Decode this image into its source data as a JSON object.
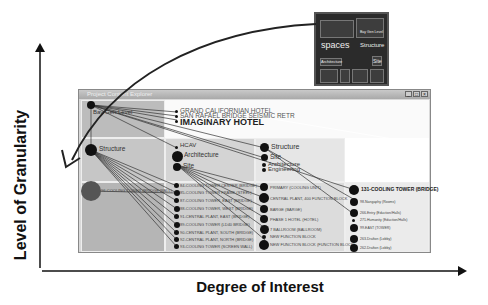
{
  "axes": {
    "y_label": "Level of Granularity",
    "x_label": "Degree of Interest"
  },
  "window": {
    "title": "Project Content Explorer",
    "buttons": [
      "_",
      "□",
      "×"
    ]
  },
  "minimap": {
    "labels": [
      "spaces",
      "Structure",
      "Site",
      "Architecture",
      "Bay Gen Level"
    ]
  },
  "nodes": {
    "root": "Bay Gen Level",
    "hotels": [
      "GRAND CALIFORNIAN HOTEL",
      "SAN RAFAEL BRIDGE SEISMIC RETR",
      "IMAGINARY HOTEL"
    ],
    "col1": [
      "Structure"
    ],
    "col2": [
      "HCAV",
      "Architecture",
      "Site"
    ],
    "col3": [
      "Structure",
      "Site",
      "Architecture",
      "Engineering"
    ],
    "level3_col1": [
      "96-COOLING TOWER (BRIDGE WALL)"
    ],
    "level3_col2": [
      "84-COOLING TOWER CENTER (BRIDGE)",
      "85-COOLING TOWER FRAME (STEEL)",
      "87-COOLING TOWER, EAST (BRIDGE)",
      "88-COOLING TOWER, WEST (BRIDGE)",
      "91-CENTRAL PLANT, EAST (BRIDGE)",
      "89-COOLING TOWER (LD40 BRIDGE)",
      "90-CENTRAL PLANT, SOUTH (BRIDGE)",
      "92-CENTRAL PLANT, NORTH (BRIDGE)",
      "93-COOLING TOWER (SCREEN WALL)"
    ],
    "level3_col3": [
      "PRIMARY (COOLING UNIT)",
      "CENTRAL PLANT, 400 FUNCTION BLOCK",
      "BARGE (BARGE)",
      "PHASE 1 HOTEL (HOTEL)",
      "7 BALLROOM (BALLROOM)",
      "NEW FUNCTION BLOCK",
      "NEW FUNCTION BLOCK (FUNCTION BLOCK)"
    ],
    "level3_col4": [
      "131-COOLING TOWER (BRIDGE)",
      "98-Nangaphy (Rooms)",
      "266-Entry (Eduction/Halls)",
      "271-Humanity (Eduction/Halls)",
      "99-EAST (TOWER)",
      "263-Drafton (Lobby)",
      "262-Drafton (Lobby)"
    ]
  }
}
